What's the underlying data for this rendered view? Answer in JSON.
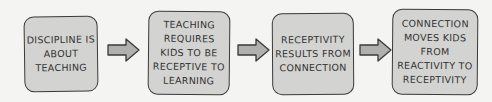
{
  "diagram": {
    "type": "flow",
    "colors": {
      "background": "#f4f4f2",
      "box_fill": "#d3d3d1",
      "box_stroke": "#3a3a3a",
      "arrow_fill": "#b0b0ae",
      "text": "#333333"
    },
    "steps": [
      {
        "label": "Discipline is\nabout\nteaching"
      },
      {
        "label": "Teaching\nrequires\nkids to be\nreceptive to\nlearning"
      },
      {
        "label": "Receptivity\nresults from\nconnection"
      },
      {
        "label": "Connection\nmoves kids from\nreactivity to\nreceptivity"
      }
    ],
    "arrows": [
      {
        "from": 0,
        "to": 1,
        "icon": "right-arrow-icon"
      },
      {
        "from": 1,
        "to": 2,
        "icon": "right-arrow-icon"
      },
      {
        "from": 2,
        "to": 3,
        "icon": "right-arrow-icon"
      }
    ]
  }
}
